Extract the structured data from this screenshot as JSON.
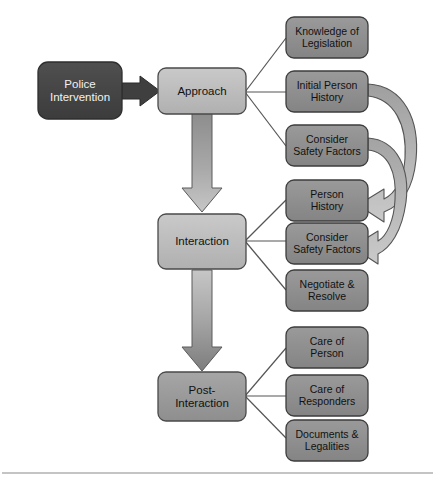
{
  "diagram": {
    "colors": {
      "dark_box": "#474747",
      "dark_box_stroke": "#2e2e2e",
      "mid_box": "#9a9a9a",
      "mid_box_stroke": "#4a4a4a",
      "light_box": "#bdbdbd",
      "light_box_stroke": "#4a4a4a",
      "side_box": "#8f8f8f",
      "side_box_stroke": "#3d3d3d",
      "connector_line": "#555555",
      "block_arrow_fill": "#b0b0b0",
      "block_arrow_stroke": "#4d4d4d",
      "curved_arrow_fill": "#b5b5b5",
      "curved_arrow_stroke": "#555555",
      "thick_arrow_fill": "#3f3f3f",
      "footer_rule": "#8a8a8a",
      "background": "#ffffff"
    },
    "source_node": {
      "id": "police-intervention",
      "label": "Police\nIntervention",
      "line1": "Police",
      "line2": "Intervention",
      "style": "dark"
    },
    "stages": [
      {
        "id": "approach",
        "label": "Approach",
        "style": "light",
        "outputs": [
          {
            "id": "knowledge-of-legislation",
            "line1": "Knowledge of",
            "line2": "Legislation"
          },
          {
            "id": "initial-person-history",
            "line1": "Initial Person",
            "line2": "History"
          },
          {
            "id": "consider-safety-factors-approach",
            "line1": "Consider",
            "line2": "Safety Factors"
          }
        ]
      },
      {
        "id": "interaction",
        "label": "Interaction",
        "style": "light",
        "outputs": [
          {
            "id": "person-history",
            "line1": "Person",
            "line2": "History"
          },
          {
            "id": "consider-safety-factors-interaction",
            "line1": "Consider",
            "line2": "Safety Factors"
          },
          {
            "id": "negotiate-and-resolve",
            "line1": "Negotiate &",
            "line2": "Resolve"
          }
        ]
      },
      {
        "id": "post-interaction",
        "label": "Post-\nInteraction",
        "line1": "Post-",
        "line2": "Interaction",
        "style": "mid",
        "outputs": [
          {
            "id": "care-of-person",
            "line1": "Care of",
            "line2": "Person"
          },
          {
            "id": "care-of-responders",
            "line1": "Care of",
            "line2": "Responders"
          },
          {
            "id": "documents-and-legalities",
            "line1": "Documents &",
            "line2": "Legalities"
          }
        ]
      }
    ],
    "feedback_arrows": [
      {
        "id": "initial-person-history-to-person-history",
        "from": "initial-person-history",
        "to": "person-history"
      },
      {
        "id": "safety-factors-approach-to-safety-factors-interaction",
        "from": "consider-safety-factors-approach",
        "to": "consider-safety-factors-interaction"
      }
    ],
    "flow_arrows": [
      {
        "id": "police-to-approach",
        "from": "police-intervention",
        "to": "approach",
        "kind": "thick-block"
      },
      {
        "id": "approach-to-interaction",
        "from": "approach",
        "to": "interaction",
        "kind": "gradient-down"
      },
      {
        "id": "interaction-to-post-interaction",
        "from": "interaction",
        "to": "post-interaction",
        "kind": "gradient-down"
      }
    ]
  }
}
